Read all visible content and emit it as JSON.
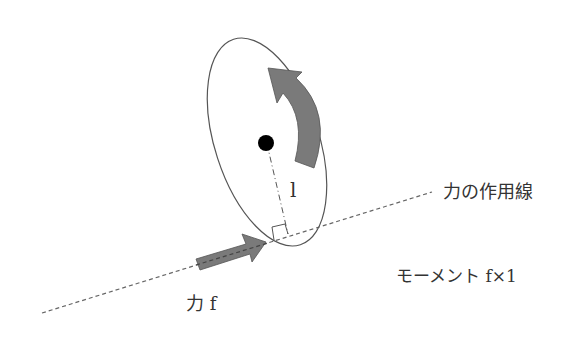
{
  "diagram": {
    "labels": {
      "line_of_action": "力の作用線",
      "moment": "モーメント f×1",
      "force": "力 f",
      "lever_arm": "l"
    },
    "colors": {
      "arrow_fill": "#7a7a7a",
      "outline": "#555555",
      "dashed": "#666666",
      "pivot": "#000000"
    }
  }
}
